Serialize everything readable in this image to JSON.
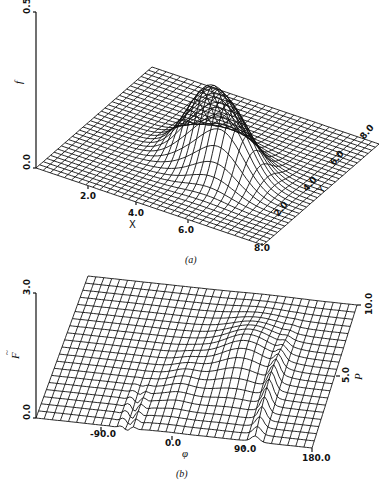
{
  "chart_data": [
    {
      "panel": "(a)",
      "type": "surface3d",
      "title": "",
      "caption": "(a)",
      "xlabel": "X",
      "ylabel": "Y",
      "zlabel": "f",
      "xlim": [
        0.0,
        8.0
      ],
      "ylim": [
        0.0,
        8.0
      ],
      "zlim": [
        0.0,
        0.5
      ],
      "x_ticks": [
        "2.0",
        "4.0",
        "6.0",
        "8.0"
      ],
      "y_ticks": [
        "2.0",
        "4.0",
        "6.0",
        "8.0"
      ],
      "z_ticks": [
        "0.0",
        "0.5"
      ],
      "grid": "wireframe mesh",
      "description": "Two Gaussian-like peaks on a flat plane",
      "peaks": [
        {
          "x": 4.0,
          "y": 4.0,
          "z": 0.32
        },
        {
          "x": 5.2,
          "y": 3.2,
          "z": 0.3
        }
      ]
    },
    {
      "panel": "(b)",
      "type": "surface3d",
      "title": "",
      "caption": "(b)",
      "xlabel": "φ",
      "ylabel": "P",
      "zlabel": "F̃",
      "xlim": [
        -180.0,
        180.0
      ],
      "ylim": [
        0.0,
        10.0
      ],
      "zlim": [
        0.0,
        3.0
      ],
      "x_ticks": [
        "-90.0",
        "0.0",
        "90.0",
        "180.0"
      ],
      "y_ticks": [
        "5.0",
        "10.0"
      ],
      "z_ticks": [
        "0.0",
        "3.0"
      ],
      "grid": "wireframe mesh",
      "description": "Ridge-shaped surface with oscillating features near φ≈-60 and φ≈110",
      "features": [
        {
          "phi": 60.0,
          "p": 6.0,
          "z": 1.2,
          "kind": "broad ridge"
        },
        {
          "phi": 110.0,
          "p": 3.0,
          "z": 1.0,
          "kind": "sharp oscillation"
        }
      ]
    }
  ],
  "panel_a": {
    "z_axis": {
      "label": "f",
      "top": "0.5",
      "bottom": "0.0"
    },
    "x_axis": {
      "label": "X",
      "ticks": [
        "2.0",
        "4.0",
        "6.0",
        "8.0"
      ]
    },
    "y_axis": {
      "label": "Y",
      "ticks": [
        "2.0",
        "4.0",
        "6.0",
        "8.0"
      ]
    },
    "caption": "(a)"
  },
  "panel_b": {
    "z_axis": {
      "label": "F",
      "accent": "~",
      "top": "3.0",
      "bottom": "0.0"
    },
    "x_axis": {
      "label": "φ",
      "ticks": [
        "-90.0",
        "0.0",
        "90.0",
        "180.0"
      ]
    },
    "y_axis": {
      "label": "P",
      "ticks": [
        "5.0",
        "10.0"
      ]
    },
    "caption": "(b)"
  }
}
